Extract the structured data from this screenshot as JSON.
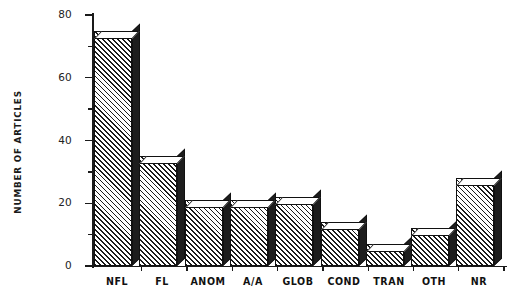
{
  "chart_data": {
    "type": "bar",
    "title": "",
    "subtitle": "",
    "xlabel": "",
    "ylabel": "NUMBER OF ARTICLES",
    "categories": [
      "NFL",
      "FL",
      "ANOM",
      "A/A",
      "GLOB",
      "COND",
      "TRAN",
      "OTH",
      "NR"
    ],
    "values": [
      75,
      35,
      21,
      21,
      22,
      14,
      7,
      12,
      28
    ],
    "series": [
      {
        "name": "Number of articles",
        "values": [
          75,
          35,
          21,
          21,
          22,
          14,
          7,
          12,
          28
        ]
      }
    ],
    "ylim": [
      0,
      80
    ],
    "y_major_ticks": [
      0,
      20,
      40,
      60,
      80
    ],
    "y_major_tick_labels": [
      "0",
      "20",
      "40",
      "60",
      "80"
    ],
    "y_minor_ticks": [
      10,
      30,
      50,
      70
    ],
    "grid": false,
    "legend": false,
    "legend_position": "none",
    "bar_style": "3d-hatched",
    "colors": {
      "bar_face": "#ffffff",
      "bar_hatch": "#1a1a1a",
      "bar_side": "#1d1d1d",
      "bar_top": "#ffffff",
      "axis": "#1a1a1a",
      "text": "#111111",
      "background": "#ffffff"
    }
  }
}
